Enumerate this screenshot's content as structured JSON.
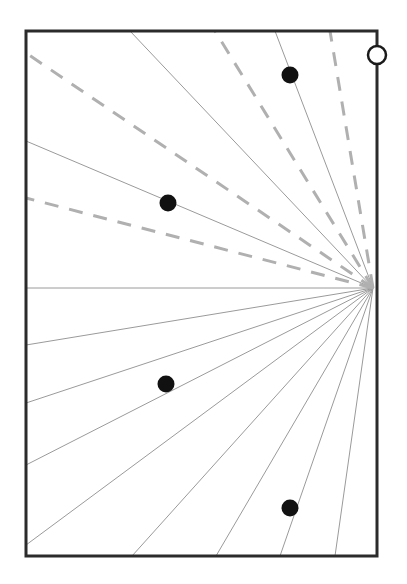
{
  "figure": {
    "type": "geometric-diagram",
    "width": 407,
    "height": 584,
    "background_color": "#ffffff"
  },
  "frame": {
    "name": "bounding-rectangle",
    "x": 26,
    "y": 31,
    "width": 351,
    "height": 525,
    "stroke_color": "#2b2b2b",
    "stroke_width": 3,
    "fill": "none"
  },
  "vanishing_point": {
    "label": "convergence-point",
    "x": 373,
    "y": 288,
    "visible_marker": false
  },
  "node_marker": {
    "label": "open-circle-node",
    "x": 377,
    "y": 55,
    "radius": 9,
    "stroke_color": "#1a1a1a",
    "stroke_width": 2.5,
    "fill": "#ffffff"
  },
  "styles": {
    "solid_ray": {
      "stroke_color": "#9a9a9a",
      "stroke_width": 1.0,
      "dash": "none"
    },
    "dashed_ray": {
      "stroke_color": "#b0b0b0",
      "stroke_width": 3.0,
      "dash": "14 11"
    },
    "dot": {
      "fill_color": "#111111",
      "radius": 8.5
    }
  },
  "chart_data": {
    "type": "scatter",
    "xlabel": "",
    "ylabel": "",
    "xlim": [
      26,
      377
    ],
    "ylim": [
      31,
      556
    ],
    "grid": false,
    "legend": "none",
    "origin": {
      "x": 373,
      "y": 288
    },
    "solid_rays": [
      {
        "id": "solid-ray-1",
        "endpoint_x": 130,
        "endpoint_y": 31,
        "edge": "top"
      },
      {
        "id": "solid-ray-2",
        "endpoint_x": 275,
        "endpoint_y": 31,
        "edge": "top"
      },
      {
        "id": "solid-ray-3",
        "endpoint_x": 26,
        "endpoint_y": 141,
        "edge": "left"
      },
      {
        "id": "solid-ray-4",
        "endpoint_x": 26,
        "endpoint_y": 288,
        "edge": "left"
      },
      {
        "id": "solid-ray-5",
        "endpoint_x": 26,
        "endpoint_y": 345,
        "edge": "left"
      },
      {
        "id": "solid-ray-6",
        "endpoint_x": 26,
        "endpoint_y": 403,
        "edge": "left"
      },
      {
        "id": "solid-ray-7",
        "endpoint_x": 26,
        "endpoint_y": 465,
        "edge": "left"
      },
      {
        "id": "solid-ray-8",
        "endpoint_x": 26,
        "endpoint_y": 545,
        "edge": "left"
      },
      {
        "id": "solid-ray-9",
        "endpoint_x": 132,
        "endpoint_y": 556,
        "edge": "bottom"
      },
      {
        "id": "solid-ray-10",
        "endpoint_x": 216,
        "endpoint_y": 556,
        "edge": "bottom"
      },
      {
        "id": "solid-ray-11",
        "endpoint_x": 280,
        "endpoint_y": 556,
        "edge": "bottom"
      },
      {
        "id": "solid-ray-12",
        "endpoint_x": 335,
        "endpoint_y": 556,
        "edge": "bottom"
      }
    ],
    "dashed_rays": [
      {
        "id": "dashed-ray-1",
        "endpoint_x": 26,
        "endpoint_y": 53,
        "edge": "left"
      },
      {
        "id": "dashed-ray-2",
        "endpoint_x": 26,
        "endpoint_y": 198,
        "edge": "left"
      },
      {
        "id": "dashed-ray-3",
        "endpoint_x": 215,
        "endpoint_y": 31,
        "edge": "top"
      },
      {
        "id": "dashed-ray-4",
        "endpoint_x": 330,
        "endpoint_y": 31,
        "edge": "top"
      }
    ],
    "points": [
      {
        "id": "point-1",
        "x": 290,
        "y": 75,
        "label": ""
      },
      {
        "id": "point-2",
        "x": 168,
        "y": 203,
        "label": ""
      },
      {
        "id": "point-3",
        "x": 166,
        "y": 384,
        "label": ""
      },
      {
        "id": "point-4",
        "x": 290,
        "y": 508,
        "label": ""
      }
    ]
  }
}
